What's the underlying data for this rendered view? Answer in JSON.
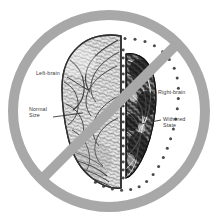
{
  "figure": {
    "background_color": "#ffffff",
    "ink_color": "#3a3a3a"
  },
  "prohibition_sign": {
    "name": "no-symbol",
    "ring_color": "#a8a8a8",
    "slash_color": "#a8a8a8",
    "center_x": 109,
    "center_y": 111,
    "outer_radius": 101,
    "ring_thickness": 10,
    "slash_angle_degrees": -45,
    "slash_direction": "top-right-to-bottom-left"
  },
  "brain": {
    "view": "superior (top-down)",
    "midline_x": 121,
    "left_hemisphere": {
      "name": "left-brain",
      "state": "normal",
      "shading": "detailed gyri, light gray"
    },
    "right_hemisphere": {
      "name": "right-brain",
      "state": "withered",
      "shading": "dark, shrunken"
    },
    "dotted_outline": {
      "name": "normal-size-outline",
      "meaning": "original normal extent of right hemisphere",
      "dot_color": "#4a4a4a",
      "dot_count": 34,
      "dot_radius": 1.5
    }
  },
  "labels": [
    {
      "id": "left-brain",
      "text": "Left-brain",
      "x": 36,
      "y": 70,
      "leader": {
        "x1": 67,
        "y1": 77,
        "x2": 88,
        "y2": 90
      }
    },
    {
      "id": "normal-size",
      "text": "Normal\nSize",
      "x": 29,
      "y": 106,
      "leader": {
        "x1": 53,
        "y1": 117,
        "x2": 83,
        "y2": 113
      }
    },
    {
      "id": "right-brain",
      "text": "Right-brain",
      "x": 158,
      "y": 89,
      "leader": {
        "x1": 156,
        "y1": 99,
        "x2": 140,
        "y2": 110
      }
    },
    {
      "id": "withered-state",
      "text": "Withered\nState",
      "x": 163,
      "y": 116,
      "leader": {
        "x1": 161,
        "y1": 120,
        "x2": 141,
        "y2": 124
      }
    }
  ]
}
